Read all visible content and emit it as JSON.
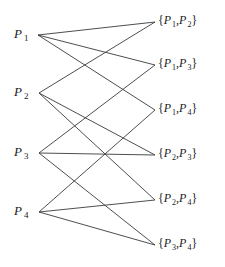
{
  "diagram": {
    "type": "bipartite-graph",
    "left_nodes": [
      {
        "id": "P1",
        "letter": "P",
        "sub": "1",
        "x": 38,
        "y": 35
      },
      {
        "id": "P2",
        "letter": "P",
        "sub": "2",
        "x": 39,
        "y": 93
      },
      {
        "id": "P3",
        "letter": "P",
        "sub": "3",
        "x": 39,
        "y": 153
      },
      {
        "id": "P4",
        "letter": "P",
        "sub": "4",
        "x": 39,
        "y": 212
      }
    ],
    "right_nodes": [
      {
        "id": "P1P2",
        "a": "1",
        "b": "2",
        "x": 155,
        "y": 22
      },
      {
        "id": "P1P3",
        "a": "1",
        "b": "3",
        "x": 155,
        "y": 65
      },
      {
        "id": "P1P4",
        "a": "1",
        "b": "4",
        "x": 155,
        "y": 110
      },
      {
        "id": "P2P3",
        "a": "2",
        "b": "3",
        "x": 155,
        "y": 155
      },
      {
        "id": "P2P4",
        "a": "2",
        "b": "4",
        "x": 155,
        "y": 200
      },
      {
        "id": "P3P4",
        "a": "3",
        "b": "4",
        "x": 155,
        "y": 245
      }
    ],
    "edges": [
      [
        "P1",
        "P1P2"
      ],
      [
        "P1",
        "P1P3"
      ],
      [
        "P1",
        "P1P4"
      ],
      [
        "P2",
        "P1P2"
      ],
      [
        "P2",
        "P2P3"
      ],
      [
        "P2",
        "P2P4"
      ],
      [
        "P3",
        "P1P3"
      ],
      [
        "P3",
        "P2P3"
      ],
      [
        "P3",
        "P3P4"
      ],
      [
        "P4",
        "P1P4"
      ],
      [
        "P4",
        "P2P4"
      ],
      [
        "P4",
        "P3P4"
      ]
    ],
    "labels": {
      "letter": "P",
      "open_brace": "{",
      "close_brace": "}",
      "comma": ","
    },
    "edge_color": "#3a3a3a"
  }
}
